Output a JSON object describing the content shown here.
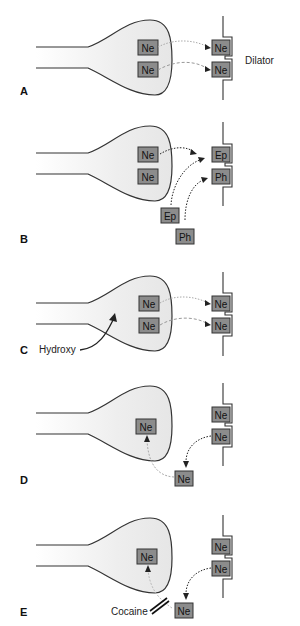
{
  "colors": {
    "terminal_fill": "#eeeeee",
    "outline": "#333333",
    "box_fill": "#8c8c8c",
    "box_stroke": "#333333",
    "arrow_dark": "#222222",
    "arrow_light": "#aaaaaa"
  },
  "panels": [
    {
      "letter": "A",
      "terminal_vesicles": [
        "Ne",
        "Ne"
      ],
      "receptors": [
        "Ne",
        "Ne"
      ],
      "side_label": "Dilator"
    },
    {
      "letter": "B",
      "terminal_vesicles": [
        "Ne",
        "Ne"
      ],
      "receptors": [
        "Ep",
        "Ph"
      ],
      "external": [
        "Ep",
        "Ph"
      ]
    },
    {
      "letter": "C",
      "terminal_vesicles": [
        "Ne",
        "Ne"
      ],
      "receptors": [
        "Ne",
        "Ne"
      ],
      "pointer_label": "Hydroxy"
    },
    {
      "letter": "D",
      "terminal_vesicles": [
        "Ne"
      ],
      "receptors": [
        "Ne",
        "Ne"
      ],
      "external": [
        "Ne"
      ]
    },
    {
      "letter": "E",
      "terminal_vesicles": [
        "Ne"
      ],
      "receptors": [
        "Ne",
        "Ne"
      ],
      "external": [
        "Ne"
      ],
      "blocker_label": "Cocaine"
    }
  ]
}
